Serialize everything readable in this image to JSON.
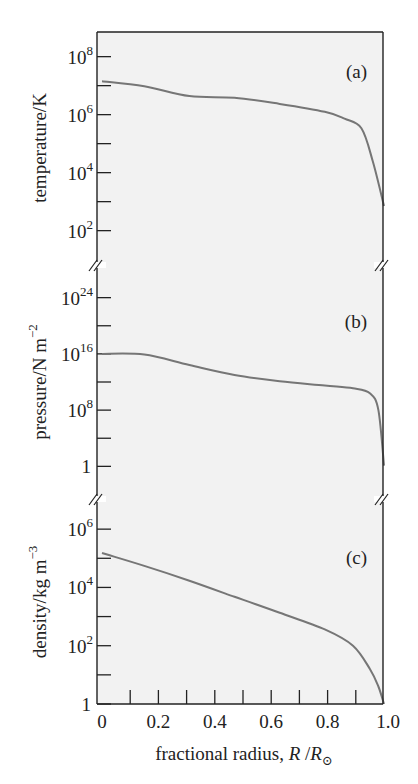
{
  "chart_data": {
    "type": "line",
    "title": "",
    "layout": "three vertically stacked panels sharing a common x-axis, log-scale y-axes, axis breaks between panels",
    "colors": {
      "background": "#f2f2f2",
      "curve": "#767676",
      "axis": "#222222"
    },
    "x": {
      "label_prefix": "fractional radius, ",
      "label_symbol": "R",
      "label_sep": " /",
      "label_sub_symbol": "R",
      "label_sub": "⊙",
      "range": [
        0,
        1.0
      ],
      "ticks": [
        0,
        0.1,
        0.2,
        0.3,
        0.4,
        0.5,
        0.6,
        0.7,
        0.8,
        0.9,
        1.0
      ],
      "tick_labels": [
        {
          "value": 0,
          "text": "0"
        },
        {
          "value": 0.2,
          "text": "0.2"
        },
        {
          "value": 0.4,
          "text": "0.4"
        },
        {
          "value": 0.6,
          "text": "0.6"
        },
        {
          "value": 0.8,
          "text": "0.8"
        },
        {
          "value": 1.0,
          "text": "1.0"
        }
      ]
    },
    "panels": [
      {
        "tag": "(a)",
        "ylabel": "temperature/K",
        "yscale": "log",
        "ylim_log10": [
          0.85,
          8.85
        ],
        "tick_log10": [
          2,
          3,
          4,
          5,
          6,
          7,
          8
        ],
        "tick_labels": [
          {
            "log10": 8,
            "base": "10",
            "exp": "8"
          },
          {
            "log10": 6,
            "base": "10",
            "exp": "6"
          },
          {
            "log10": 4,
            "base": "10",
            "exp": "4"
          },
          {
            "log10": 2,
            "base": "10",
            "exp": "2"
          }
        ],
        "series": [
          {
            "name": "temperature",
            "x": [
              0,
              0.15,
              0.31,
              0.47,
              0.63,
              0.79,
              0.86,
              0.92,
              0.96,
              1.0
            ],
            "log10_y": [
              7.15,
              6.98,
              6.64,
              6.58,
              6.37,
              6.1,
              5.86,
              5.53,
              4.4,
              2.85
            ]
          }
        ]
      },
      {
        "tag": "(b)",
        "ylabel": "pressure/N m",
        "ylabel_exp": "−2",
        "yscale": "log",
        "ylim_log10": [
          -4.5,
          28.5
        ],
        "tick_log10": [
          0,
          4,
          8,
          12,
          16,
          20,
          24
        ],
        "tick_labels": [
          {
            "log10": 24,
            "base": "10",
            "exp": "24"
          },
          {
            "log10": 16,
            "base": "10",
            "exp": "16"
          },
          {
            "log10": 8,
            "base": "10",
            "exp": "8"
          },
          {
            "log10": 0,
            "base": "1",
            "exp": ""
          }
        ],
        "series": [
          {
            "name": "pressure",
            "x": [
              0,
              0.15,
              0.31,
              0.47,
              0.63,
              0.79,
              0.89,
              0.95,
              0.98,
              1.0
            ],
            "log10_y": [
              16.0,
              15.9,
              14.4,
              13.0,
              12.1,
              11.5,
              11.1,
              10.4,
              8.0,
              0.1
            ]
          }
        ]
      },
      {
        "tag": "(c)",
        "ylabel": "density/kg m",
        "ylabel_exp": "−3",
        "yscale": "log",
        "ylim_log10": [
          0,
          7.0
        ],
        "tick_log10": [
          0,
          1,
          2,
          3,
          4,
          5,
          6
        ],
        "tick_labels": [
          {
            "log10": 6,
            "base": "10",
            "exp": "6"
          },
          {
            "log10": 4,
            "base": "10",
            "exp": "4"
          },
          {
            "log10": 2,
            "base": "10",
            "exp": "2"
          },
          {
            "log10": 0,
            "base": "1",
            "exp": ""
          }
        ],
        "series": [
          {
            "name": "density",
            "x": [
              0,
              0.15,
              0.31,
              0.47,
              0.63,
              0.79,
              0.89,
              0.95,
              0.98,
              1.0
            ],
            "log10_y": [
              5.18,
              4.74,
              4.23,
              3.68,
              3.13,
              2.56,
              2.0,
              1.2,
              0.6,
              0.0
            ]
          }
        ]
      }
    ]
  }
}
